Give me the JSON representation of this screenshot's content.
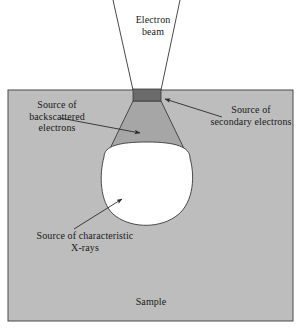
{
  "figure": {
    "type": "diagram"
  },
  "labels": {
    "electron_beam": "Electron\nbeam",
    "backscattered": "Source of\nbackscattered\nelectrons",
    "secondary": "Source of\nsecondary electrons",
    "xrays": "Source of characteristic\nX-rays",
    "sample": "Sample"
  },
  "colors": {
    "page_background": "#ffffff",
    "sample_fill": "#bdbdbd",
    "sample_border": "#4a4a4a",
    "backscattered_fill": "#a6a6a6",
    "secondary_fill": "#6b6b6b",
    "xray_fill": "#ffffff",
    "outline": "#3a3a3a",
    "text": "#1a1a1a",
    "beam_line": "#4a4a4a"
  },
  "geometry": {
    "sample_rect": {
      "x": 8,
      "y": 90,
      "width": 285,
      "height": 231
    },
    "secondary_rect": {
      "x": 133,
      "y": 89,
      "width": 28,
      "height": 12
    },
    "backscattered_trapezoid": "M133,101 L161,101 L190,160 L104,160 Z",
    "xray_volume": "M104,157 C104,143 190,143 190,158 C196,180 192,205 176,216 C158,228 130,228 114,214 C100,202 99,176 104,157 Z",
    "beam_left_line": {
      "x1": 113,
      "y1": 0,
      "x2": 133,
      "y2": 90
    },
    "beam_right_line": {
      "x1": 180,
      "y1": 0,
      "x2": 161,
      "y2": 90
    }
  },
  "annotations": {
    "backscattered_leader": {
      "from_x": 60,
      "from_y": 118,
      "to_x": 142,
      "to_y": 133
    },
    "secondary_leader": {
      "from_x": 222,
      "from_y": 117,
      "to_x": 163,
      "to_y": 99
    },
    "xrays_leader": {
      "from_x": 74,
      "from_y": 229,
      "to_x": 124,
      "to_y": 197
    }
  }
}
